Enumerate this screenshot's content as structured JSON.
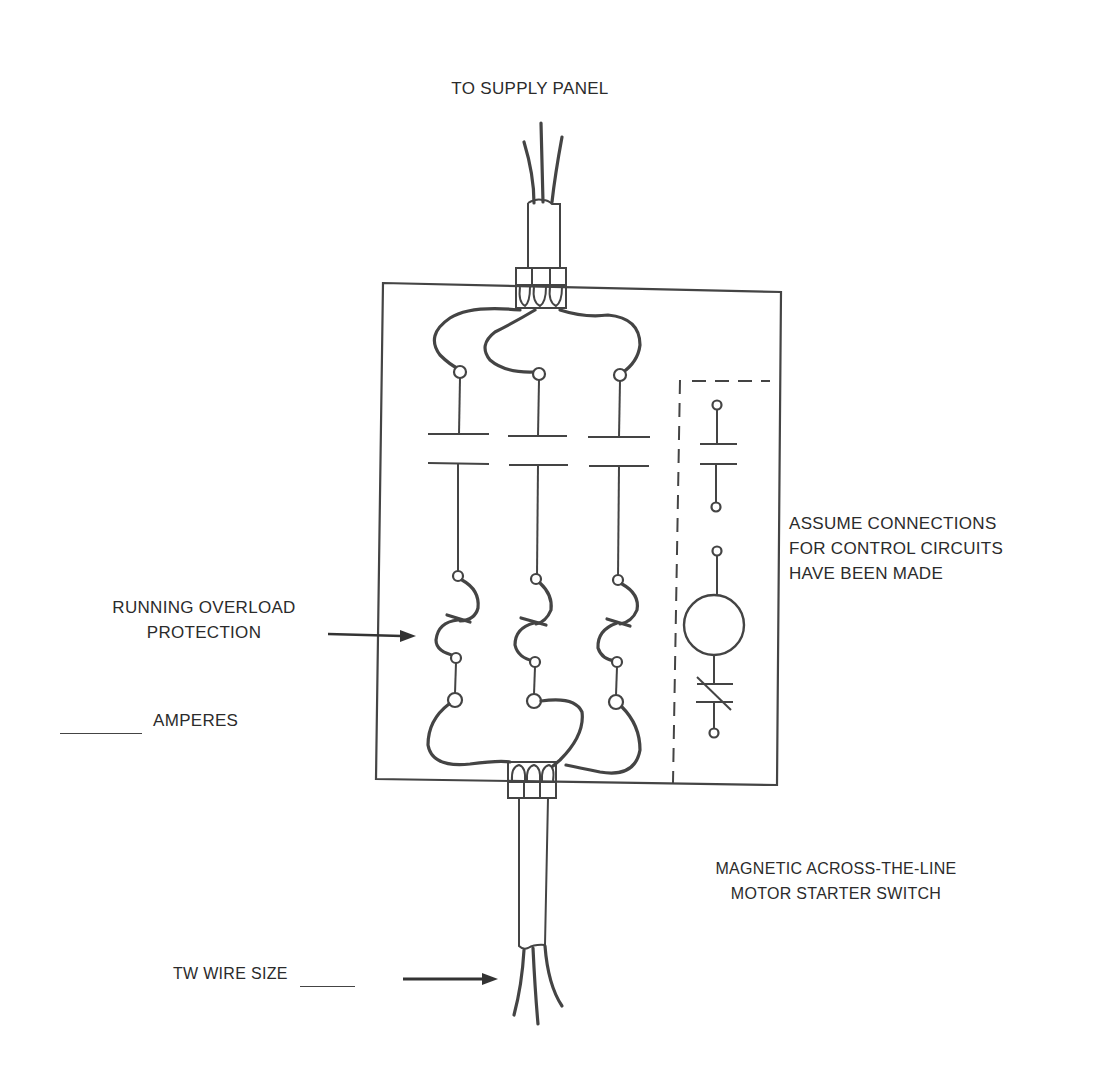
{
  "diagram": {
    "labels": {
      "supply": "TO SUPPLY PANEL",
      "control_note": [
        "ASSUME CONNECTIONS",
        "FOR CONTROL CIRCUITS",
        "HAVE BEEN MADE"
      ],
      "overload": [
        "RUNNING OVERLOAD",
        "PROTECTION"
      ],
      "amperes": "AMPERES",
      "device_name": [
        "MAGNETIC ACROSS-THE-LINE",
        "MOTOR STARTER SWITCH"
      ],
      "wire_size": "TW WIRE SIZE"
    },
    "blanks": {
      "amperes_value": "",
      "wire_size_value": ""
    },
    "components": {
      "main_contacts": 3,
      "overload_heaters": 3,
      "control_circuit": [
        "normally-open auxiliary contact",
        "coil",
        "normally-closed overload contact"
      ]
    },
    "colors": {
      "ink": "#444444",
      "paper": "#ffffff"
    }
  }
}
